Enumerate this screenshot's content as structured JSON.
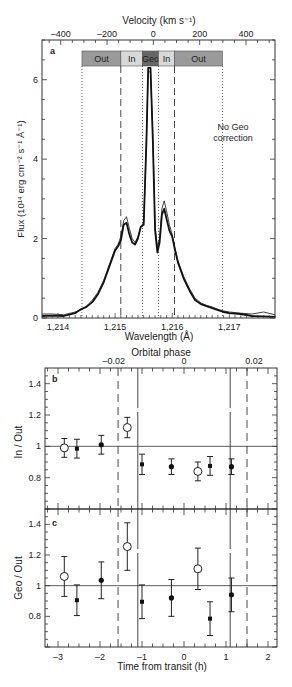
{
  "chart_data": [
    {
      "panel": "a",
      "type": "line",
      "xlabel": "Wavelength (Å)",
      "ylabel": "Flux (10¹⁴ erg cm⁻² s⁻¹ Å⁻¹)",
      "top_xlabel": "Velocity (km s⁻¹)",
      "xlim": [
        1213.72,
        1217.8
      ],
      "ylim": [
        0,
        7.0
      ],
      "x_ticks": [
        "1,214",
        "1,215",
        "1,216",
        "1,217"
      ],
      "x_tick_values": [
        1214,
        1215,
        1216,
        1217
      ],
      "y_ticks": [
        "0",
        "2",
        "4",
        "6"
      ],
      "y_tick_values": [
        0,
        2,
        4,
        6
      ],
      "top_ticks": [
        "–400",
        "–200",
        "0",
        "200",
        "400"
      ],
      "top_tick_values": [
        -400,
        -200,
        0,
        200,
        400
      ],
      "bands": [
        {
          "label": "Out",
          "from": 1214.42,
          "to": 1215.1,
          "color": "#9a9a9a"
        },
        {
          "label": "In",
          "from": 1215.1,
          "to": 1215.48,
          "color": "#d8d8d8"
        },
        {
          "label": "Geo",
          "from": 1215.48,
          "to": 1215.76,
          "color": "#666666"
        },
        {
          "label": "In",
          "from": 1215.76,
          "to": 1216.04,
          "color": "#d8d8d8"
        },
        {
          "label": "Out",
          "from": 1216.04,
          "to": 1216.88,
          "color": "#9a9a9a"
        }
      ],
      "dotted_lines": [
        1214.42,
        1215.48,
        1215.76,
        1216.88
      ],
      "dashed_lines": [
        1215.1,
        1216.04
      ],
      "annotation": "No Geo correction",
      "series": [
        {
          "name": "thick",
          "x": [
            1213.72,
            1213.9,
            1214.1,
            1214.3,
            1214.4,
            1214.5,
            1214.6,
            1214.7,
            1214.8,
            1214.9,
            1215.0,
            1215.05,
            1215.1,
            1215.15,
            1215.2,
            1215.25,
            1215.3,
            1215.35,
            1215.4,
            1215.45,
            1215.5,
            1215.55,
            1215.58,
            1215.62,
            1215.66,
            1215.7,
            1215.74,
            1215.78,
            1215.82,
            1215.86,
            1215.9,
            1215.95,
            1216.0,
            1216.05,
            1216.1,
            1216.2,
            1216.3,
            1216.4,
            1216.5,
            1216.6,
            1216.7,
            1216.8,
            1216.9,
            1217.0,
            1217.2,
            1217.4,
            1217.6,
            1217.8
          ],
          "y": [
            0.05,
            0.06,
            0.05,
            0.12,
            0.22,
            0.28,
            0.4,
            0.6,
            0.9,
            1.3,
            1.7,
            1.8,
            1.95,
            2.35,
            2.4,
            2.1,
            1.9,
            1.85,
            2.0,
            2.3,
            2.35,
            4.5,
            6.3,
            6.3,
            4.5,
            2.2,
            1.65,
            1.9,
            2.6,
            2.75,
            2.5,
            2.2,
            2.05,
            1.7,
            1.4,
            1.0,
            0.7,
            0.45,
            0.35,
            0.3,
            0.25,
            0.2,
            0.15,
            0.12,
            0.1,
            0.05,
            0.04,
            0.03
          ]
        },
        {
          "name": "thin",
          "x": [
            1213.72,
            1213.9,
            1214.1,
            1214.3,
            1214.4,
            1214.5,
            1214.6,
            1214.7,
            1214.8,
            1214.9,
            1215.0,
            1215.05,
            1215.1,
            1215.15,
            1215.2,
            1215.25,
            1215.3,
            1215.35,
            1215.4,
            1215.45,
            1215.5,
            1215.55,
            1215.58,
            1215.62,
            1215.66,
            1215.7,
            1215.74,
            1215.78,
            1215.82,
            1215.86,
            1215.9,
            1215.95,
            1216.0,
            1216.05,
            1216.1,
            1216.2,
            1216.3,
            1216.4,
            1216.5,
            1216.6,
            1216.7,
            1216.8,
            1216.9,
            1217.0,
            1217.2,
            1217.4,
            1217.6,
            1217.8
          ],
          "y": [
            0.1,
            0.1,
            0.08,
            0.15,
            0.2,
            0.3,
            0.45,
            0.65,
            0.95,
            1.35,
            1.75,
            1.85,
            2.05,
            2.45,
            2.55,
            2.25,
            2.0,
            1.9,
            2.05,
            2.3,
            2.4,
            4.6,
            6.2,
            6.2,
            4.6,
            2.3,
            1.8,
            2.0,
            2.75,
            2.95,
            2.7,
            2.35,
            2.1,
            1.75,
            1.45,
            1.05,
            0.75,
            0.5,
            0.38,
            0.32,
            0.28,
            0.22,
            0.18,
            0.15,
            0.12,
            0.1,
            0.15,
            0.08
          ]
        }
      ]
    },
    {
      "panel": "b",
      "type": "scatter",
      "xlabel": "Time from transit (h)",
      "ylabel": "In / Out",
      "top_xlabel": "Orbital phase",
      "top_ticks": [
        "–0.02",
        "0",
        "0.02"
      ],
      "xlim": [
        -3.3,
        2.2
      ],
      "ylim": [
        0.6,
        1.5
      ],
      "y_ticks": [
        "0.8",
        "1",
        "1.2",
        "1.4"
      ],
      "y_tick_values": [
        0.8,
        1.0,
        1.2,
        1.4
      ],
      "reference_line": 1.0,
      "solid_vlines": [
        -1.1,
        1.1
      ],
      "dashed_vlines": [
        -1.57,
        1.5
      ],
      "points": [
        {
          "x": -2.85,
          "y": 0.99,
          "err": 0.06,
          "marker": "open"
        },
        {
          "x": -2.55,
          "y": 0.985,
          "err": 0.06,
          "marker": "filled_small"
        },
        {
          "x": -1.97,
          "y": 1.01,
          "err": 0.06,
          "marker": "filled"
        },
        {
          "x": -1.35,
          "y": 1.12,
          "err": 0.065,
          "marker": "open"
        },
        {
          "x": -1.0,
          "y": 0.885,
          "err": 0.065,
          "marker": "filled_small"
        },
        {
          "x": -0.3,
          "y": 0.87,
          "err": 0.05,
          "marker": "filled"
        },
        {
          "x": 0.33,
          "y": 0.84,
          "err": 0.06,
          "marker": "open"
        },
        {
          "x": 0.62,
          "y": 0.875,
          "err": 0.06,
          "marker": "filled_small"
        },
        {
          "x": 1.13,
          "y": 0.87,
          "err": 0.05,
          "marker": "filled"
        }
      ]
    },
    {
      "panel": "c",
      "type": "scatter",
      "xlabel": "Time from transit (h)",
      "ylabel": "Geo / Out",
      "x_ticks": [
        "–3",
        "–2",
        "–1",
        "0",
        "1",
        "2"
      ],
      "x_tick_values": [
        -3,
        -2,
        -1,
        0,
        1,
        2
      ],
      "xlim": [
        -3.3,
        2.2
      ],
      "ylim": [
        0.6,
        1.5
      ],
      "y_ticks": [
        "0.8",
        "1",
        "1.2",
        "1.4"
      ],
      "y_tick_values": [
        0.8,
        1.0,
        1.2,
        1.4
      ],
      "reference_line": 1.0,
      "solid_vlines": [
        -1.1,
        1.1
      ],
      "dashed_vlines": [
        -1.57,
        1.5
      ],
      "points": [
        {
          "x": -2.85,
          "y": 1.06,
          "err": 0.13,
          "marker": "open"
        },
        {
          "x": -2.55,
          "y": 0.905,
          "err": 0.1,
          "marker": "filled_small"
        },
        {
          "x": -1.97,
          "y": 1.035,
          "err": 0.12,
          "marker": "filled"
        },
        {
          "x": -1.35,
          "y": 1.255,
          "err": 0.155,
          "marker": "open"
        },
        {
          "x": -1.0,
          "y": 0.895,
          "err": 0.11,
          "marker": "filled_small"
        },
        {
          "x": -0.3,
          "y": 0.92,
          "err": 0.12,
          "marker": "filled"
        },
        {
          "x": 0.33,
          "y": 1.11,
          "err": 0.135,
          "marker": "open"
        },
        {
          "x": 0.62,
          "y": 0.785,
          "err": 0.11,
          "marker": "filled_small"
        },
        {
          "x": 1.13,
          "y": 0.94,
          "err": 0.11,
          "marker": "filled"
        }
      ]
    }
  ],
  "labels": {
    "panel_a": "a",
    "panel_b": "b",
    "panel_c": "c",
    "velocity_title": "Velocity (km s⁻¹)",
    "wavelength_title": "Wavelength (Å)",
    "flux_title": "Flux (10¹⁴ erg cm⁻² s⁻¹ Å⁻¹)",
    "no_geo_line1": "No Geo",
    "no_geo_line2": "correction",
    "orbital_phase_title": "Orbital phase",
    "in_out_title": "In / Out",
    "geo_out_title": "Geo / Out",
    "time_title": "Time from transit (h)"
  }
}
